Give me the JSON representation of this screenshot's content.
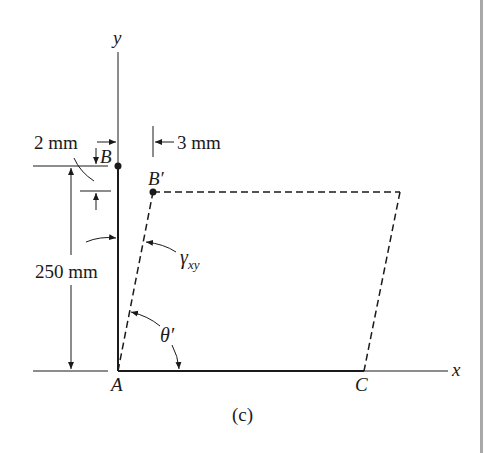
{
  "figure": {
    "caption": "(c)",
    "axes": {
      "x_label": "x",
      "y_label": "y"
    },
    "points": {
      "A": "A",
      "B": "B",
      "B_prime": "B′",
      "C": "C"
    },
    "dimensions": {
      "vertical_displacement": "2 mm",
      "horizontal_displacement": "3 mm",
      "height": "250 mm"
    },
    "angles": {
      "shear_strain": {
        "symbol": "γ",
        "subscript": "xy"
      },
      "theta_prime": "θ′"
    },
    "colors": {
      "line": "#1a1a1a",
      "background": "#ffffff",
      "side_bar": "#a8a8a8"
    }
  }
}
